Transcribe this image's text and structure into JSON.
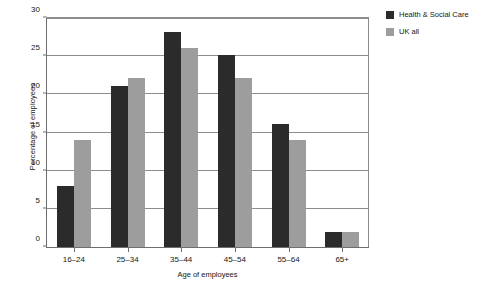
{
  "chart_data": {
    "type": "bar",
    "title": "",
    "xlabel": "Age of employees",
    "ylabel": "Percentage of employees",
    "categories": [
      "16–24",
      "25–34",
      "35–44",
      "45–54",
      "55–64",
      "65+"
    ],
    "series": [
      {
        "name": "Health & Social Care",
        "color": "#2b2b2b",
        "values": [
          8,
          21,
          28,
          25,
          16,
          2
        ]
      },
      {
        "name": "UK all",
        "color": "#9d9d9d",
        "values": [
          14,
          22,
          26,
          22,
          14,
          2
        ]
      }
    ],
    "ylim": [
      0,
      30
    ],
    "yticks": [
      0,
      5,
      10,
      15,
      20,
      25,
      30
    ],
    "ytick_labels": [
      "0",
      "5",
      "10",
      "15",
      "20",
      "25",
      "30"
    ],
    "grid": "horizontal",
    "legend_position": "right-top"
  },
  "legend": {
    "items": [
      {
        "label": "Health & Social Care",
        "swatch": "dark"
      },
      {
        "label": "UK all",
        "swatch": "light"
      }
    ]
  }
}
